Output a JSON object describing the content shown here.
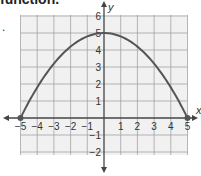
{
  "header": {
    "text": "function.",
    "bullet": "."
  },
  "chart_data": {
    "type": "line",
    "title": "",
    "xlabel": "x",
    "ylabel": "y",
    "xlim": [
      -5,
      5
    ],
    "ylim": [
      -2,
      6
    ],
    "grid": true,
    "x_ticks": [
      "-5",
      "-4",
      "-3",
      "-2",
      "-1",
      "1",
      "2",
      "3",
      "4",
      "5"
    ],
    "y_ticks": [
      "-2",
      "-1",
      "1",
      "2",
      "3",
      "4",
      "5",
      "6"
    ],
    "series": [
      {
        "name": "parabola",
        "equation": "y = 5 - 0.2x^2",
        "x": [
          -5,
          -4,
          -3,
          -2,
          -1,
          0,
          1,
          2,
          3,
          4,
          5
        ],
        "values": [
          0,
          1.8,
          3.2,
          4.2,
          4.8,
          5,
          4.8,
          4.2,
          3.2,
          1.8,
          0
        ]
      }
    ],
    "points": [
      {
        "x": -5,
        "y": 0
      },
      {
        "x": 5,
        "y": 0
      }
    ],
    "colors": {
      "curve": "#555555",
      "grid": "#9a9a9a",
      "grid_bg": "#f1f1f1",
      "axis": "#444444"
    }
  }
}
